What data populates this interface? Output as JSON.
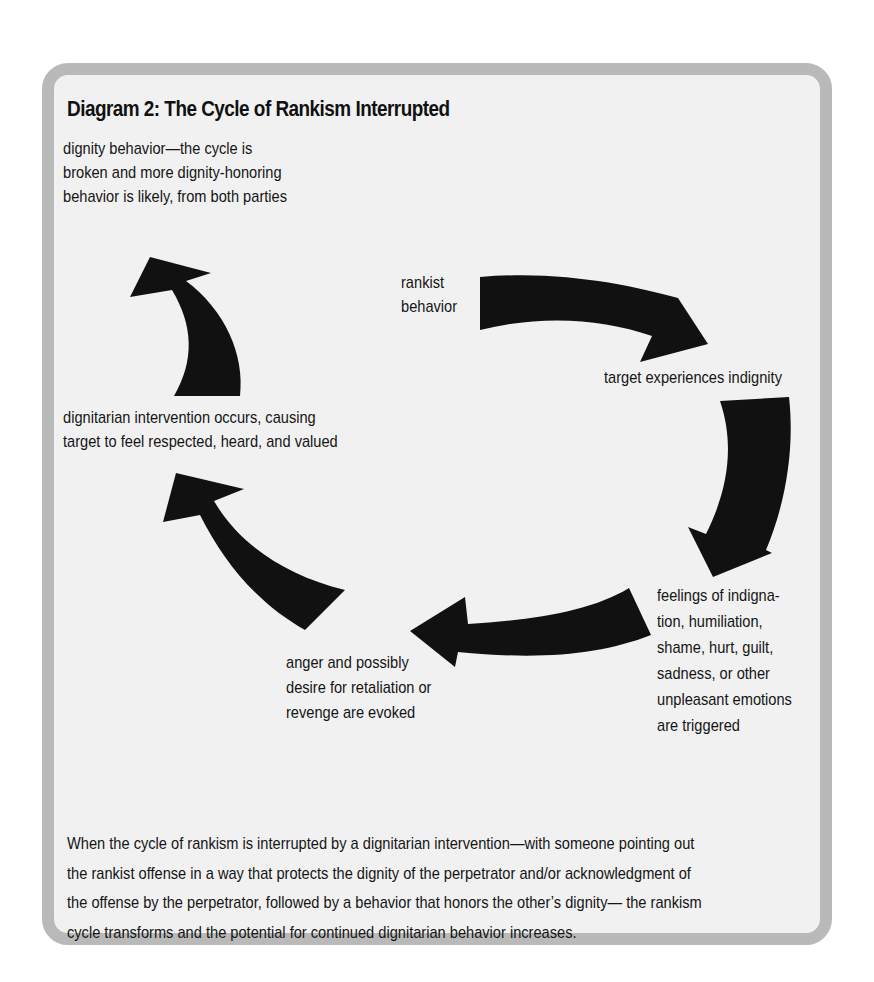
{
  "diagram": {
    "title": "Diagram 2: The Cycle of Rankism Interrupted",
    "type": "cycle",
    "colors": {
      "frame_border": "#b9b9b9",
      "frame_fill": "#f1f1f1",
      "arrow": "#111111",
      "text": "#151515"
    },
    "nodes": [
      {
        "id": "rankist-behavior",
        "lines": [
          "rankist",
          "behavior"
        ]
      },
      {
        "id": "target-experiences-indignity",
        "lines": [
          "target experiences indignity"
        ]
      },
      {
        "id": "feelings-triggered",
        "lines": [
          "feelings of indigna-",
          "tion, humiliation,",
          "shame, hurt, guilt,",
          "sadness, or other",
          "unpleasant emotions",
          "are triggered"
        ]
      },
      {
        "id": "anger-evoked",
        "lines": [
          "anger and possibly",
          "desire for retaliation or",
          "revenge are evoked"
        ]
      },
      {
        "id": "dignitarian-intervention",
        "lines": [
          "dignitarian intervention occurs, causing",
          "target to feel respected, heard, and valued"
        ]
      },
      {
        "id": "dignity-behavior",
        "lines": [
          "dignity behavior—the cycle is",
          "broken and more dignity-honoring",
          "behavior is likely, from both parties"
        ]
      }
    ],
    "edges": [
      {
        "from": "rankist-behavior",
        "to": "target-experiences-indignity"
      },
      {
        "from": "target-experiences-indignity",
        "to": "feelings-triggered"
      },
      {
        "from": "feelings-triggered",
        "to": "anger-evoked"
      },
      {
        "from": "anger-evoked",
        "to": "dignitarian-intervention"
      },
      {
        "from": "dignitarian-intervention",
        "to": "dignity-behavior"
      }
    ],
    "caption_lines": [
      "When the cycle of rankism is interrupted by a dignitarian intervention—with someone pointing out",
      "the rankist offense in a way that protects the dignity of the perpetrator and/or acknowledgment of",
      "the offense by the perpetrator, followed by a behavior that honors the other’s dignity— the rankism",
      "cycle transforms and the potential for continued dignitarian behavior increases."
    ]
  }
}
